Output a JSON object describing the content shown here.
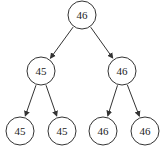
{
  "diagram": {
    "type": "binary-tree",
    "colors": {
      "stroke": "#333333",
      "text": "#222222",
      "background": "#ffffff"
    },
    "nodes": [
      {
        "id": "root",
        "label": "46",
        "cx": 82,
        "cy": 15,
        "r": 14
      },
      {
        "id": "left",
        "label": "45",
        "cx": 41,
        "cy": 71,
        "r": 14
      },
      {
        "id": "right",
        "label": "46",
        "cx": 122,
        "cy": 71,
        "r": 14
      },
      {
        "id": "left-left",
        "label": "45",
        "cx": 20,
        "cy": 131,
        "r": 14
      },
      {
        "id": "left-right",
        "label": "45",
        "cx": 62,
        "cy": 131,
        "r": 14
      },
      {
        "id": "right-left",
        "label": "46",
        "cx": 103,
        "cy": 131,
        "r": 14
      },
      {
        "id": "right-right",
        "label": "46",
        "cx": 145,
        "cy": 131,
        "r": 14
      }
    ],
    "edges": [
      {
        "from": "root",
        "to": "left"
      },
      {
        "from": "root",
        "to": "right"
      },
      {
        "from": "left",
        "to": "left-left"
      },
      {
        "from": "left",
        "to": "left-right"
      },
      {
        "from": "right",
        "to": "right-left"
      },
      {
        "from": "right",
        "to": "right-right"
      }
    ]
  }
}
